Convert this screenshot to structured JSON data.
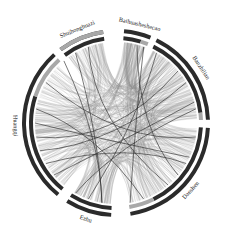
{
  "chart_data": {
    "type": "chord",
    "title": "",
    "center": [
      116,
      123
    ],
    "radii": {
      "outer_track": [
        90,
        94
      ],
      "inner_track": [
        83,
        87
      ],
      "chord": 81,
      "label": 101
    },
    "colors": {
      "track_dark": "#2b2b2b",
      "track_light": "#a8a8a8",
      "chord_light": "#8a8a8a",
      "chord_dark": "#2a2a2a",
      "label": "#222222"
    },
    "sectors": [
      {
        "name": "Baihuasheshecao",
        "start": 5,
        "end": 22,
        "inner_split": 0.7
      },
      {
        "name": "Banzhilian",
        "start": 26,
        "end": 88,
        "inner_split": 0.92
      },
      {
        "name": "Danshen",
        "start": 93,
        "end": 171,
        "inner_split": 0.78
      },
      {
        "name": "Ezhu",
        "start": 183,
        "end": 212,
        "inner_split": 1.0
      },
      {
        "name": "Huangqi",
        "start": 219,
        "end": 318,
        "inner_split": 0.7
      },
      {
        "name": "Shuihonghuazi",
        "start": 323,
        "end": 352,
        "inner_split": 0.15
      }
    ],
    "links": [
      {
        "source": "Huangqi",
        "target": "Banzhilian",
        "weight": "high"
      },
      {
        "source": "Huangqi",
        "target": "Danshen",
        "weight": "high"
      },
      {
        "source": "Huangqi",
        "target": "Ezhu",
        "weight": "medium"
      },
      {
        "source": "Huangqi",
        "target": "Baihuasheshecao",
        "weight": "medium"
      },
      {
        "source": "Huangqi",
        "target": "Shuihonghuazi",
        "weight": "medium"
      },
      {
        "source": "Danshen",
        "target": "Banzhilian",
        "weight": "high"
      },
      {
        "source": "Danshen",
        "target": "Ezhu",
        "weight": "medium"
      },
      {
        "source": "Danshen",
        "target": "Baihuasheshecao",
        "weight": "medium"
      },
      {
        "source": "Banzhilian",
        "target": "Baihuasheshecao",
        "weight": "medium"
      },
      {
        "source": "Banzhilian",
        "target": "Shuihonghuazi",
        "weight": "medium"
      },
      {
        "source": "Ezhu",
        "target": "Banzhilian",
        "weight": "medium"
      },
      {
        "source": "Shuihonghuazi",
        "target": "Danshen",
        "weight": "low"
      }
    ],
    "legend": null,
    "grid": false
  },
  "labels": {
    "s0": "Baihuasheshecao",
    "s1": "Banzhilian",
    "s2": "Danshen",
    "s3": "Ezhu",
    "s4": "Huangqi",
    "s5": "Shuihonghuazi"
  }
}
